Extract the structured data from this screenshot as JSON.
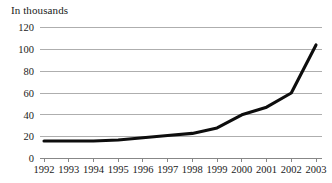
{
  "chart_data": {
    "type": "line",
    "title": "In thousands",
    "xlabel": "",
    "ylabel": "",
    "categories": [
      "1992",
      "1993",
      "1994",
      "1995",
      "1996",
      "1997",
      "1998",
      "1999",
      "2000",
      "2001",
      "2002",
      "2003"
    ],
    "values": [
      16,
      16,
      16,
      17,
      19,
      21,
      23,
      28,
      40,
      47,
      60,
      104
    ],
    "series": [
      {
        "name": "In thousands",
        "values": [
          16,
          16,
          16,
          17,
          19,
          21,
          23,
          28,
          40,
          47,
          60,
          104
        ]
      }
    ],
    "ylim": [
      0,
      120
    ],
    "yticks": [
      0,
      20,
      40,
      60,
      80,
      100,
      120
    ],
    "ytick_labels": [
      "0",
      "20",
      "40",
      "60",
      "80",
      "100",
      "120"
    ],
    "grid": true,
    "grid_axis": "y",
    "legend": false,
    "legend_position": "none",
    "line_color": "#0d0d0d",
    "grid_color": "#9a9a9a",
    "background_color": "#ffffff",
    "text_color": "#1a1a1a"
  }
}
